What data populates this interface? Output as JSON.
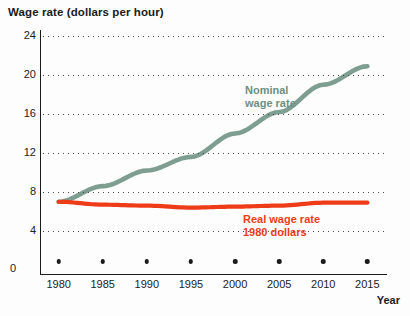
{
  "chart_data": {
    "type": "line",
    "title": "Wage rate (dollars per hour)",
    "xlabel": "Year",
    "ylabel": "Wage rate (dollars per hour)",
    "xlim": [
      1978,
      2017
    ],
    "ylim": [
      0,
      24
    ],
    "yticks": [
      24,
      20,
      16,
      12,
      8,
      4,
      0
    ],
    "xticks": [
      1980,
      1985,
      1990,
      1995,
      2000,
      2005,
      2010,
      2015
    ],
    "grid": "horizontal dotted",
    "legend_position": "inline annotations",
    "x": [
      1980,
      1985,
      1990,
      1995,
      2000,
      2005,
      2010,
      2015
    ],
    "series": [
      {
        "name": "Nominal wage rate",
        "color": "#7d9e90",
        "values": [
          7.0,
          8.6,
          10.2,
          11.6,
          14.0,
          16.2,
          19.0,
          20.9
        ]
      },
      {
        "name": "Real wage rate 1980 dollars",
        "color": "#ef3c18",
        "values": [
          7.0,
          6.7,
          6.6,
          6.4,
          6.5,
          6.6,
          6.9,
          6.9
        ]
      }
    ],
    "annotations": [
      {
        "text": "Nominal\nwage rate",
        "color": "#6d8f81"
      },
      {
        "text": "Real wage rate\n1980 dollars",
        "color": "#ee3b17"
      }
    ]
  },
  "axes": {
    "y_title": "Wage rate (dollars per hour)",
    "x_title": "Year",
    "y_labels": [
      "24",
      "20",
      "16",
      "12",
      "8",
      "4",
      "0"
    ],
    "x_labels": [
      "1980",
      "1985",
      "1990",
      "1995",
      "2000",
      "2005",
      "2010",
      "2015"
    ]
  },
  "labels": {
    "nominal": "Nominal\nwage rate",
    "real": "Real wage rate\n1980 dollars"
  },
  "colors": {
    "nominal": "#7d9e90",
    "real": "#ef3c18",
    "axis": "#1b1b1b",
    "background": "#fdfdfd"
  }
}
